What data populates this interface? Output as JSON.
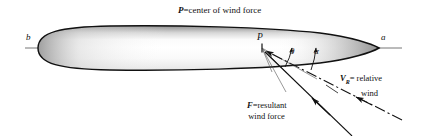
{
  "diagram": {
    "title": "P=center of wind force",
    "title_symbol": "P",
    "title_rest": "=center of wind force",
    "hull": {
      "stern_label": "b",
      "bow_label": "a",
      "center_point_label": "P"
    },
    "angles": [
      {
        "name": "theta",
        "label": "θ"
      },
      {
        "name": "alpha",
        "label": "α"
      }
    ],
    "vectors": [
      {
        "name": "relative-wind",
        "symbol": "V",
        "subscript": "R",
        "equals": "= relative",
        "line2": "wind",
        "style": "dash-dot"
      },
      {
        "name": "resultant-wind-force",
        "symbol": "F",
        "subscript": "",
        "equals": "=resultant",
        "line2": "wind force",
        "style": "solid"
      }
    ],
    "colors": {
      "stroke": "#111111",
      "axis": "#555555",
      "shade_dark": "#9a9a9a",
      "shade_light": "#ffffff",
      "text": "#111111"
    }
  }
}
